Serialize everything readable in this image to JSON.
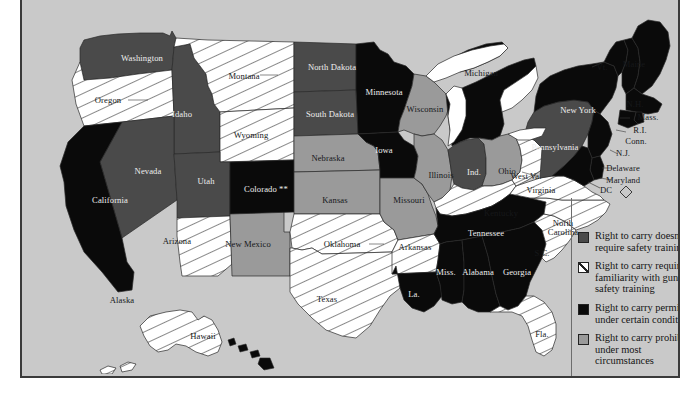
{
  "map": {
    "title_visible": false,
    "background_color": "#c9c9c9",
    "border_color": "#3a3a3a",
    "ocean_color": "#c9c9c9",
    "lake_color": "#ffffff",
    "dc_marker": "◇",
    "dc_label": "DC",
    "colorado_note": "**"
  },
  "legend": {
    "items": [
      {
        "swatch": "dark-gray",
        "color": "#4a4a4a",
        "label": "Right to carry doesn't require safety training"
      },
      {
        "swatch": "white-hatched",
        "color": "#ffffff",
        "label": "Right to carry requires familiarity with guns or safety training"
      },
      {
        "swatch": "black",
        "color": "#0a0a0a",
        "label": "Right to carry permitted under certain conditions"
      },
      {
        "swatch": "mid-gray",
        "color": "#9a9a9a",
        "label": "Right to carry prohibited under most circumstances"
      }
    ]
  },
  "states": [
    {
      "id": "WA",
      "label": "Washington",
      "category": "dark-gray",
      "lx": 120,
      "ly": 54,
      "tone": "light"
    },
    {
      "id": "OR",
      "label": "Oregon",
      "category": "hatched",
      "lx": 86,
      "ly": 96,
      "tone": "dark"
    },
    {
      "id": "ID",
      "label": "Idaho",
      "category": "dark-gray",
      "lx": 160,
      "ly": 110,
      "tone": "light"
    },
    {
      "id": "MT",
      "label": "Montana",
      "category": "hatched",
      "lx": 222,
      "ly": 72,
      "tone": "dark"
    },
    {
      "id": "WY",
      "label": "Wyoming",
      "category": "hatched",
      "lx": 229,
      "ly": 131,
      "tone": "dark"
    },
    {
      "id": "NV",
      "label": "Nevada",
      "category": "dark-gray",
      "lx": 126,
      "ly": 167,
      "tone": "light"
    },
    {
      "id": "UT",
      "label": "Utah",
      "category": "dark-gray",
      "lx": 184,
      "ly": 177,
      "tone": "light"
    },
    {
      "id": "CA",
      "label": "California",
      "category": "black",
      "lx": 88,
      "ly": 196,
      "tone": "light"
    },
    {
      "id": "AZ",
      "label": "Arizona",
      "category": "hatched",
      "lx": 155,
      "ly": 237,
      "tone": "dark"
    },
    {
      "id": "NM",
      "label": "New Mexico",
      "category": "mid-gray",
      "lx": 226,
      "ly": 240,
      "tone": "dark"
    },
    {
      "id": "CO",
      "label": "Colorado **",
      "category": "black",
      "lx": 244,
      "ly": 185,
      "tone": "light"
    },
    {
      "id": "ND",
      "label": "North Dakota",
      "category": "dark-gray",
      "lx": 310,
      "ly": 63,
      "tone": "light"
    },
    {
      "id": "SD",
      "label": "South Dakota",
      "category": "dark-gray",
      "lx": 308,
      "ly": 110,
      "tone": "light"
    },
    {
      "id": "NE",
      "label": "Nebraska",
      "category": "mid-gray",
      "lx": 306,
      "ly": 154,
      "tone": "dark"
    },
    {
      "id": "KS",
      "label": "Kansas",
      "category": "mid-gray",
      "lx": 313,
      "ly": 196,
      "tone": "dark"
    },
    {
      "id": "OK",
      "label": "Oklahoma",
      "category": "hatched",
      "lx": 320,
      "ly": 240,
      "tone": "dark"
    },
    {
      "id": "TX",
      "label": "Texas",
      "category": "hatched",
      "lx": 305,
      "ly": 295,
      "tone": "dark"
    },
    {
      "id": "MN",
      "label": "Minnesota",
      "category": "black",
      "lx": 362,
      "ly": 88,
      "tone": "light"
    },
    {
      "id": "IA",
      "label": "Iowa",
      "category": "black",
      "lx": 362,
      "ly": 146,
      "tone": "light"
    },
    {
      "id": "MO",
      "label": "Missouri",
      "category": "mid-gray",
      "lx": 387,
      "ly": 196,
      "tone": "dark"
    },
    {
      "id": "AR",
      "label": "Arkansas",
      "category": "hatched",
      "lx": 393,
      "ly": 243,
      "tone": "dark"
    },
    {
      "id": "LA",
      "label": "La.",
      "category": "black",
      "lx": 392,
      "ly": 290,
      "tone": "light"
    },
    {
      "id": "WI",
      "label": "Wisconsin",
      "category": "mid-gray",
      "lx": 403,
      "ly": 105,
      "tone": "dark"
    },
    {
      "id": "IL",
      "label": "Illinois",
      "category": "mid-gray",
      "lx": 419,
      "ly": 171,
      "tone": "dark"
    },
    {
      "id": "IN",
      "label": "Ind.",
      "category": "dark-gray",
      "lx": 452,
      "ly": 168,
      "tone": "light"
    },
    {
      "id": "MI",
      "label": "Michigan",
      "category": "black",
      "lx": 459,
      "ly": 69,
      "tone": "dark"
    },
    {
      "id": "OH",
      "label": "Ohio",
      "category": "mid-gray",
      "lx": 485,
      "ly": 167,
      "tone": "dark"
    },
    {
      "id": "KY",
      "label": "Kentucky",
      "category": "hatched",
      "lx": 479,
      "ly": 209,
      "tone": "dark"
    },
    {
      "id": "TN",
      "label": "Tennessee",
      "category": "black",
      "lx": 464,
      "ly": 229,
      "tone": "light"
    },
    {
      "id": "MS",
      "label": "Miss.",
      "category": "black",
      "lx": 424,
      "ly": 268,
      "tone": "light"
    },
    {
      "id": "AL",
      "label": "Alabama",
      "category": "black",
      "lx": 456,
      "ly": 268,
      "tone": "light"
    },
    {
      "id": "GA",
      "label": "Georgia",
      "category": "black",
      "lx": 495,
      "ly": 268,
      "tone": "light"
    },
    {
      "id": "FL",
      "label": "Fla.",
      "category": "hatched",
      "lx": 520,
      "ly": 330,
      "tone": "dark"
    },
    {
      "id": "SC",
      "label": "S.C.",
      "category": "hatched",
      "lx": 520,
      "ly": 249,
      "tone": "dark"
    },
    {
      "id": "NC",
      "label": "North Carolina",
      "category": "hatched",
      "lx": 541,
      "ly": 219,
      "tone": "dark"
    },
    {
      "id": "VA",
      "label": "Virginia",
      "category": "hatched",
      "lx": 519,
      "ly": 186,
      "tone": "dark"
    },
    {
      "id": "WV",
      "label": "West Va.",
      "category": "hatched",
      "lx": 504,
      "ly": 172,
      "tone": "dark"
    },
    {
      "id": "PA",
      "label": "Pennsylvania",
      "category": "dark-gray",
      "lx": 533,
      "ly": 143,
      "tone": "light"
    },
    {
      "id": "NY",
      "label": "New York",
      "category": "black",
      "lx": 556,
      "ly": 106,
      "tone": "light"
    },
    {
      "id": "VT",
      "label": "Vt.",
      "category": "black",
      "lx": 580,
      "ly": 63,
      "tone": "dark"
    },
    {
      "id": "ME",
      "label": "Maine",
      "category": "black",
      "lx": 612,
      "ly": 60,
      "tone": "dark"
    },
    {
      "id": "NH",
      "label": "N.H.",
      "category": "black",
      "lx": 613,
      "ly": 100,
      "tone": "dark"
    },
    {
      "id": "MA",
      "label": "Mass.",
      "category": "black",
      "lx": 626,
      "ly": 113,
      "tone": "dark"
    },
    {
      "id": "RI",
      "label": "R.I.",
      "category": "black",
      "lx": 618,
      "ly": 126,
      "tone": "dark"
    },
    {
      "id": "CT",
      "label": "Conn.",
      "category": "black",
      "lx": 614,
      "ly": 137,
      "tone": "dark"
    },
    {
      "id": "NJ",
      "label": "N.J.",
      "category": "black",
      "lx": 601,
      "ly": 149,
      "tone": "dark"
    },
    {
      "id": "DE",
      "label": "Delaware",
      "category": "black",
      "lx": 601,
      "ly": 164,
      "tone": "dark"
    },
    {
      "id": "MD",
      "label": "Maryland",
      "category": "black",
      "lx": 601,
      "ly": 176,
      "tone": "dark"
    },
    {
      "id": "AK",
      "label": "Alaska",
      "category": "hatched",
      "lx": 100,
      "ly": 296,
      "tone": "dark"
    },
    {
      "id": "HI",
      "label": "Hawaii",
      "category": "black",
      "lx": 181,
      "ly": 332,
      "tone": "dark"
    }
  ]
}
